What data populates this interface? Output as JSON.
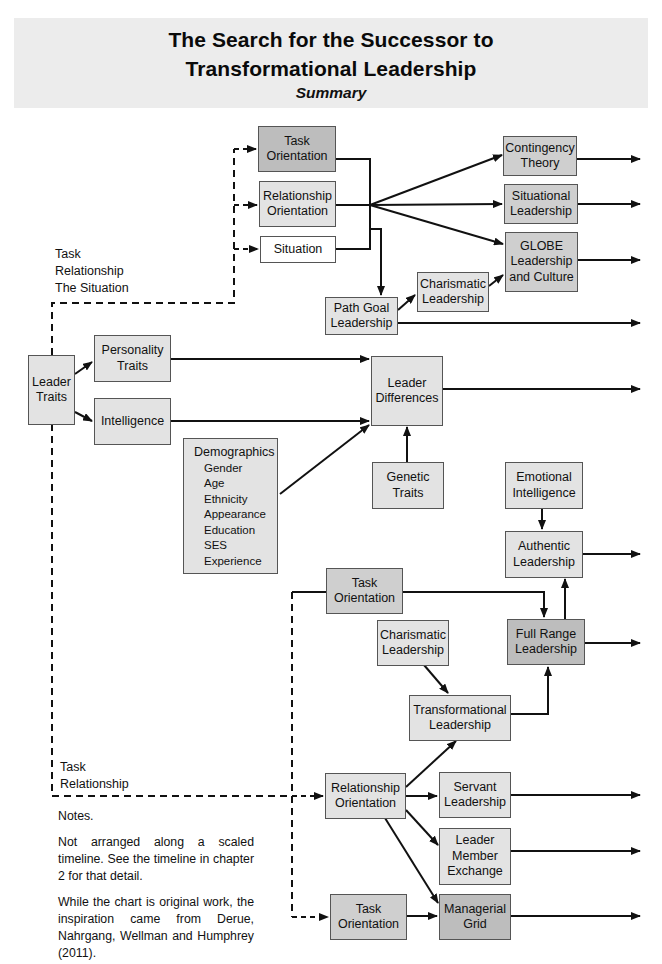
{
  "header": {
    "title_line1": "The Search for the Successor to",
    "title_line2": "Transformational Leadership",
    "subtitle": "Summary"
  },
  "colors": {
    "header_bg": "#ececec",
    "box_light": "#e3e3e3",
    "box_mid": "#cfcfcf",
    "box_dark": "#bdbdbd",
    "box_white": "#ffffff",
    "line": "#111111"
  },
  "nodes": {
    "task_orientation_top": {
      "line1": "Task",
      "line2": "Orientation"
    },
    "relationship_orientation_top": {
      "line1": "Relationship",
      "line2": "Orientation"
    },
    "situation": {
      "line1": "Situation"
    },
    "contingency_theory": {
      "line1": "Contingency",
      "line2": "Theory"
    },
    "situational_leadership": {
      "line1": "Situational",
      "line2": "Leadership"
    },
    "globe": {
      "line1": "GLOBE",
      "line2": "Leadership",
      "line3": "and Culture"
    },
    "charismatic_top": {
      "line1": "Charismatic",
      "line2": "Leadership"
    },
    "path_goal": {
      "line1": "Path Goal",
      "line2": "Leadership"
    },
    "leader_traits": {
      "line1": "Leader",
      "line2": "Traits"
    },
    "personality_traits": {
      "line1": "Personality",
      "line2": "Traits"
    },
    "intelligence": {
      "line1": "Intelligence"
    },
    "leader_differences": {
      "line1": "Leader",
      "line2": "Differences"
    },
    "demographics": {
      "heading": "Demographics",
      "items": [
        "Gender",
        "Age",
        "Ethnicity",
        "Appearance",
        "Education",
        "SES",
        "Experience"
      ]
    },
    "genetic_traits": {
      "line1": "Genetic",
      "line2": "Traits"
    },
    "emotional_intelligence": {
      "line1": "Emotional",
      "line2": "Intelligence"
    },
    "authentic_leadership": {
      "line1": "Authentic",
      "line2": "Leadership"
    },
    "task_orientation_mid": {
      "line1": "Task",
      "line2": "Orientation"
    },
    "charismatic_mid": {
      "line1": "Charismatic",
      "line2": "Leadership"
    },
    "full_range": {
      "line1": "Full Range",
      "line2": "Leadership"
    },
    "transformational": {
      "line1": "Transformational",
      "line2": "Leadership"
    },
    "relationship_orientation_bottom": {
      "line1": "Relationship",
      "line2": "Orientation"
    },
    "servant": {
      "line1": "Servant",
      "line2": "Leadership"
    },
    "lmx": {
      "line1": "Leader",
      "line2": "Member",
      "line3": "Exchange"
    },
    "task_orientation_bottom": {
      "line1": "Task",
      "line2": "Orientation"
    },
    "managerial_grid": {
      "line1": "Managerial",
      "line2": "Grid"
    }
  },
  "labels": {
    "upper_branch": [
      "Task",
      "Relationship",
      "The Situation"
    ],
    "lower_branch": [
      "Task",
      "Relationship"
    ]
  },
  "notes": {
    "heading": "Notes.",
    "para1": "Not arranged along a scaled timeline. See the timeline in chapter 2 for that detail.",
    "para2": "While the chart is original work, the inspiration came from Derue, Nahrgang, Wellman and Humphrey (2011)."
  }
}
